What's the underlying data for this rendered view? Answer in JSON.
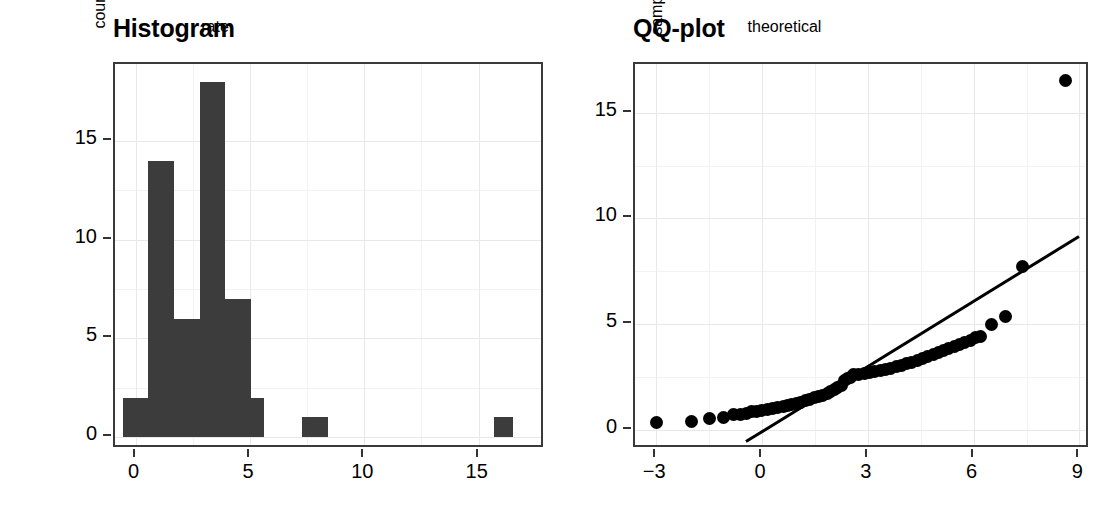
{
  "figure": {
    "background": "#ffffff",
    "panel_border_color": "#3a3a3a",
    "grid_color": "#ededed",
    "bar_color": "#3c3c3c",
    "point_color": "#000000"
  },
  "panels": {
    "histogram": {
      "title": "Histogram",
      "xlabel": "rate",
      "ylabel": "count"
    },
    "qqplot": {
      "title": "QQ-plot",
      "xlabel": "theoretical",
      "ylabel": "sample"
    }
  },
  "chart_data": [
    {
      "type": "bar",
      "title": "Histogram",
      "xlabel": "rate",
      "ylabel": "count",
      "xlim": [
        -0.9,
        17.9
      ],
      "ylim": [
        -0.6,
        18.9
      ],
      "xticks": [
        0,
        5,
        10,
        15
      ],
      "xtick_labels": [
        "0",
        "5",
        "10",
        "15"
      ],
      "yticks": [
        0,
        5,
        10,
        15
      ],
      "ytick_labels": [
        "0",
        "5",
        "10",
        "15"
      ],
      "grid": true,
      "bin_width": 1.12,
      "bins": [
        {
          "x_start": -0.56,
          "x_end": 0.56,
          "center": 0.0,
          "count": 2
        },
        {
          "x_start": 0.56,
          "x_end": 1.68,
          "center": 1.12,
          "count": 14
        },
        {
          "x_start": 1.68,
          "x_end": 2.8,
          "center": 2.24,
          "count": 6
        },
        {
          "x_start": 2.8,
          "x_end": 3.92,
          "center": 3.36,
          "count": 18
        },
        {
          "x_start": 3.92,
          "x_end": 5.04,
          "center": 4.48,
          "count": 7
        },
        {
          "x_start": 5.04,
          "x_end": 5.6,
          "center": 5.32,
          "count": 2
        },
        {
          "x_start": 7.28,
          "x_end": 8.4,
          "center": 7.84,
          "count": 1
        },
        {
          "x_start": 15.68,
          "x_end": 16.5,
          "center": 16.1,
          "count": 1
        }
      ],
      "categories": [
        "0",
        "1.1",
        "2.2",
        "3.4",
        "4.5",
        "5.3",
        "7.8",
        "16.1"
      ],
      "values": [
        2,
        14,
        6,
        18,
        7,
        2,
        1,
        1
      ]
    },
    {
      "type": "scatter",
      "title": "QQ-plot",
      "xlabel": "theoretical",
      "ylabel": "sample",
      "xlim": [
        -3.6,
        9.3
      ],
      "ylim": [
        -0.9,
        17.3
      ],
      "xticks": [
        -3,
        0,
        3,
        6,
        9
      ],
      "xtick_labels": [
        "−3",
        "0",
        "3",
        "6",
        "9"
      ],
      "yticks": [
        0,
        5,
        10,
        15
      ],
      "ytick_labels": [
        "0",
        "5",
        "10",
        "15"
      ],
      "grid": true,
      "reference_line": {
        "x": [
          -0.45,
          9.0
        ],
        "y": [
          -0.55,
          9.15
        ]
      },
      "points": [
        {
          "x": -3.0,
          "y": 0.35
        },
        {
          "x": -2.0,
          "y": 0.42
        },
        {
          "x": -1.5,
          "y": 0.55
        },
        {
          "x": -1.1,
          "y": 0.6
        },
        {
          "x": -0.8,
          "y": 0.72
        },
        {
          "x": -0.62,
          "y": 0.75
        },
        {
          "x": -0.45,
          "y": 0.8
        },
        {
          "x": -0.3,
          "y": 0.85
        },
        {
          "x": -0.15,
          "y": 0.88
        },
        {
          "x": 0.0,
          "y": 0.92
        },
        {
          "x": 0.15,
          "y": 0.96
        },
        {
          "x": 0.3,
          "y": 1.0
        },
        {
          "x": 0.45,
          "y": 1.05
        },
        {
          "x": 0.6,
          "y": 1.1
        },
        {
          "x": 0.72,
          "y": 1.15
        },
        {
          "x": 0.85,
          "y": 1.2
        },
        {
          "x": 0.98,
          "y": 1.26
        },
        {
          "x": 1.1,
          "y": 1.32
        },
        {
          "x": 1.22,
          "y": 1.38
        },
        {
          "x": 1.35,
          "y": 1.45
        },
        {
          "x": 1.48,
          "y": 1.52
        },
        {
          "x": 1.6,
          "y": 1.58
        },
        {
          "x": 1.72,
          "y": 1.65
        },
        {
          "x": 1.85,
          "y": 1.72
        },
        {
          "x": 1.95,
          "y": 1.8
        },
        {
          "x": 2.05,
          "y": 1.9
        },
        {
          "x": 2.15,
          "y": 2.0
        },
        {
          "x": 2.25,
          "y": 2.1
        },
        {
          "x": 2.35,
          "y": 2.35
        },
        {
          "x": 2.42,
          "y": 2.42
        },
        {
          "x": 2.5,
          "y": 2.5
        },
        {
          "x": 2.6,
          "y": 2.6
        },
        {
          "x": 2.75,
          "y": 2.63
        },
        {
          "x": 2.9,
          "y": 2.66
        },
        {
          "x": 3.05,
          "y": 2.7
        },
        {
          "x": 3.2,
          "y": 2.75
        },
        {
          "x": 3.35,
          "y": 2.8
        },
        {
          "x": 3.5,
          "y": 2.85
        },
        {
          "x": 3.65,
          "y": 2.92
        },
        {
          "x": 3.8,
          "y": 3.0
        },
        {
          "x": 3.95,
          "y": 3.06
        },
        {
          "x": 4.1,
          "y": 3.12
        },
        {
          "x": 4.25,
          "y": 3.2
        },
        {
          "x": 4.4,
          "y": 3.28
        },
        {
          "x": 4.55,
          "y": 3.36
        },
        {
          "x": 4.7,
          "y": 3.45
        },
        {
          "x": 4.85,
          "y": 3.55
        },
        {
          "x": 5.0,
          "y": 3.65
        },
        {
          "x": 5.15,
          "y": 3.75
        },
        {
          "x": 5.3,
          "y": 3.85
        },
        {
          "x": 5.45,
          "y": 3.95
        },
        {
          "x": 5.6,
          "y": 4.05
        },
        {
          "x": 5.75,
          "y": 4.15
        },
        {
          "x": 5.9,
          "y": 4.25
        },
        {
          "x": 6.05,
          "y": 4.35
        },
        {
          "x": 6.2,
          "y": 4.4
        },
        {
          "x": 6.5,
          "y": 5.0
        },
        {
          "x": 6.9,
          "y": 5.35
        },
        {
          "x": 7.4,
          "y": 7.75
        },
        {
          "x": 8.6,
          "y": 16.5
        }
      ]
    }
  ]
}
